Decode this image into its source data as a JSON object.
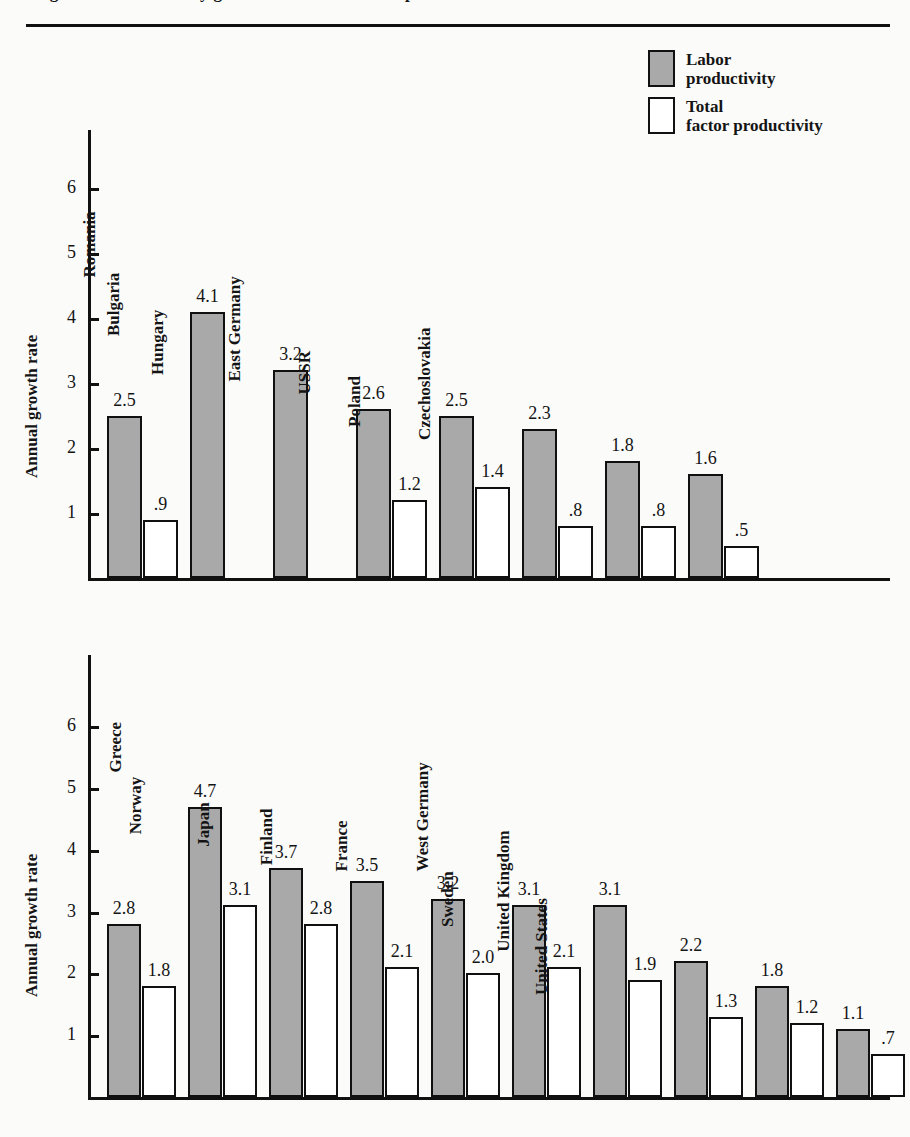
{
  "page": {
    "cut_title": "Figure x.x  Productivity growth in socialist and capitalist economies, 1960-1979",
    "background": "#fbfbfa",
    "ink": "#111111",
    "gray_fill": "#a9a9a9"
  },
  "legend": {
    "position": "top-right",
    "entries": [
      {
        "label": "Labor\nproductivity",
        "label_line1": "Labor",
        "label_line2": "productivity",
        "swatch": "gray",
        "color": "#a9a9a9",
        "icon": "square-swatch-gray"
      },
      {
        "label": "Total\nfactor productivity",
        "label_line1": "Total",
        "label_line2": "factor productivity",
        "swatch": "white",
        "color": "#ffffff",
        "icon": "square-swatch-white"
      }
    ]
  },
  "chart_data": [
    {
      "id": "socialist",
      "type": "bar",
      "title": "",
      "xlabel": "",
      "ylabel": "Annual growth rate",
      "ylim": [
        0,
        6.75
      ],
      "yticks": [
        1,
        2,
        3,
        4,
        5,
        6
      ],
      "ytick_labels": [
        "1",
        "2",
        "3",
        "4",
        "5",
        "6"
      ],
      "grid": false,
      "legend_position": "figure-top-right",
      "categories": [
        "Socialist average",
        "Romania",
        "Bulgaria",
        "Hungary",
        "East Germany",
        "USSR",
        "Poland",
        "Czechoslovakia"
      ],
      "series": [
        {
          "name": "Labor productivity",
          "color": "#a9a9a9",
          "values": [
            2.5,
            4.1,
            3.2,
            2.6,
            2.5,
            2.3,
            1.8,
            1.6
          ],
          "labels": [
            "2.5",
            "4.1",
            "3.2",
            "2.6",
            "2.5",
            "2.3",
            "1.8",
            "1.6"
          ]
        },
        {
          "name": "Total factor productivity",
          "color": "#ffffff",
          "values": [
            0.9,
            null,
            null,
            1.2,
            1.4,
            0.8,
            0.8,
            0.5
          ],
          "labels": [
            ".9",
            "",
            "",
            "1.2",
            "1.4",
            ".8",
            ".8",
            ".5"
          ]
        }
      ]
    },
    {
      "id": "capitalist",
      "type": "bar",
      "title": "",
      "xlabel": "",
      "ylabel": "Annual growth rate",
      "ylim": [
        0,
        6.75
      ],
      "yticks": [
        1,
        2,
        3,
        4,
        5,
        6
      ],
      "ytick_labels": [
        "1",
        "2",
        "3",
        "4",
        "5",
        "6"
      ],
      "grid": false,
      "legend_position": "figure-top-right",
      "categories": [
        "Capitalist average",
        "Greece",
        "Norway",
        "Japan",
        "Finland",
        "France",
        "West Germany",
        "Sweden",
        "United Kingdom",
        "United States"
      ],
      "series": [
        {
          "name": "Labor productivity",
          "color": "#a9a9a9",
          "values": [
            2.8,
            4.7,
            3.7,
            3.5,
            3.2,
            3.1,
            3.1,
            2.2,
            1.8,
            1.1
          ],
          "labels": [
            "2.8",
            "4.7",
            "3.7",
            "3.5",
            "3.2",
            "3.1",
            "3.1",
            "2.2",
            "1.8",
            "1.1"
          ]
        },
        {
          "name": "Total factor productivity",
          "color": "#ffffff",
          "values": [
            1.8,
            3.1,
            2.8,
            2.1,
            2.0,
            2.1,
            1.9,
            1.3,
            1.2,
            0.7
          ],
          "labels": [
            "1.8",
            "3.1",
            "2.8",
            "2.1",
            "2.0",
            "2.1",
            "1.9",
            "1.3",
            "1.2",
            ".7"
          ]
        }
      ]
    }
  ]
}
